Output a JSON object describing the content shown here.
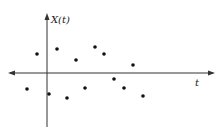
{
  "chart_data": {
    "type": "scatter",
    "title": "",
    "xlabel": "t",
    "ylabel": "X(t)",
    "grid": false,
    "legend": null,
    "axes": {
      "x_axis_pixel_y": 73,
      "y_axis_pixel_x": 47,
      "x_arrows": "both",
      "y_arrow": "up"
    },
    "points_px": [
      [
        27,
        89
      ],
      [
        37,
        54
      ],
      [
        49,
        94
      ],
      [
        57,
        49
      ],
      [
        67,
        98
      ],
      [
        76,
        60
      ],
      [
        85,
        88
      ],
      [
        95,
        47
      ],
      [
        104,
        54
      ],
      [
        114,
        79
      ],
      [
        124,
        88
      ],
      [
        133,
        65
      ],
      [
        143,
        96
      ]
    ],
    "points": [
      {
        "t": -2,
        "x": -1.6
      },
      {
        "t": -1,
        "x": 1.9
      },
      {
        "t": 0.2,
        "x": -2.1
      },
      {
        "t": 1,
        "x": 2.4
      },
      {
        "t": 2,
        "x": -2.5
      },
      {
        "t": 2.9,
        "x": 1.3
      },
      {
        "t": 3.8,
        "x": -1.5
      },
      {
        "t": 4.8,
        "x": 2.6
      },
      {
        "t": 5.7,
        "x": 1.9
      },
      {
        "t": 6.7,
        "x": -0.6
      },
      {
        "t": 7.7,
        "x": -1.5
      },
      {
        "t": 8.6,
        "x": 0.8
      },
      {
        "t": 9.6,
        "x": -2.3
      }
    ]
  }
}
